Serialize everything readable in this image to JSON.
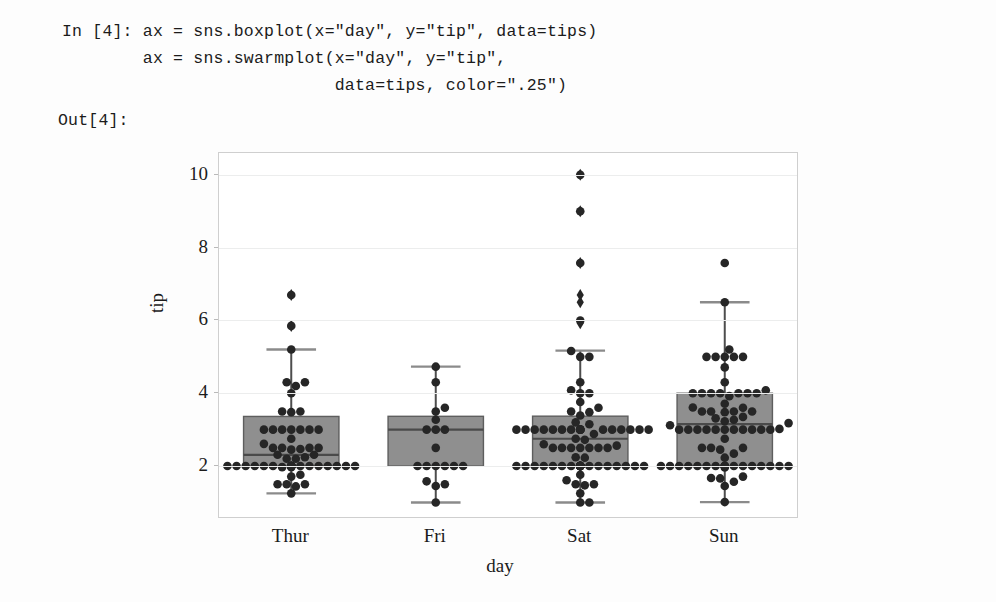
{
  "notebook": {
    "in_prompt": "In [4]:",
    "out_prompt": "Out[4]:",
    "code_line_1": "In [4]: ax = sns.boxplot(x=\"day\", y=\"tip\", data=tips)",
    "code_line_2": "        ax = sns.swarmplot(x=\"day\", y=\"tip\",",
    "code_line_3": "                           data=tips, color=\".25\")",
    "out_line": "Out[4]:"
  },
  "chart_data": {
    "type": "box",
    "title": "",
    "xlabel": "day",
    "ylabel": "tip",
    "categories": [
      "Thur",
      "Fri",
      "Sat",
      "Sun"
    ],
    "yticks": [
      2,
      4,
      6,
      8,
      10
    ],
    "ylim": [
      0.6,
      10.6
    ],
    "grid": true,
    "legend": "none",
    "box_color": "#8f8f8f",
    "line_color": "#4d4d4d",
    "point_color": "#262626",
    "series": [
      {
        "name": "Thur",
        "q1": 2.0,
        "median": 2.305,
        "q3": 3.3625,
        "whisker_low": 1.25,
        "whisker_high": 5.2,
        "outliers": [
          5.85,
          6.7
        ],
        "points": [
          3.0,
          1.5,
          2.2,
          3.48,
          1.71,
          2.31,
          4.3,
          2.0,
          2.0,
          2.0,
          2.0,
          2.0,
          1.5,
          1.76,
          1.97,
          2.31,
          1.44,
          2.5,
          3.0,
          5.85,
          2.0,
          2.0,
          2.0,
          3.0,
          2.5,
          2.0,
          2.61,
          2.0,
          2.24,
          4.2,
          3.5,
          2.0,
          2.0,
          4.0,
          2.0,
          3.0,
          2.5,
          2.5,
          2.0,
          2.0,
          2.2,
          2.0,
          6.7,
          3.0,
          2.0,
          3.5,
          2.75,
          2.0,
          2.45,
          1.25,
          2.0,
          2.0,
          1.5,
          2.0,
          2.0,
          2.47,
          3.0,
          4.3,
          5.2,
          1.97,
          3.0,
          2.0
        ]
      },
      {
        "name": "Fri",
        "q1": 2.0,
        "median": 3.0,
        "q3": 3.3662,
        "whisker_low": 1.0,
        "whisker_high": 4.73,
        "outliers": [],
        "points": [
          4.3,
          3.0,
          1.45,
          2.5,
          3.5,
          2.0,
          3.27,
          3.6,
          1.0,
          2.0,
          1.5,
          4.73,
          2.0,
          2.0,
          1.58,
          2.0,
          3.0,
          2.0,
          3.0
        ]
      },
      {
        "name": "Sat",
        "q1": 2.0,
        "median": 2.75,
        "q3": 3.37,
        "whisker_low": 1.0,
        "whisker_high": 5.17,
        "outliers": [
          5.92,
          6.5,
          6.7,
          7.58,
          9.0,
          10.0
        ],
        "points": [
          2.0,
          3.0,
          2.5,
          3.0,
          3.0,
          1.5,
          2.0,
          3.2,
          3.15,
          2.0,
          3.0,
          1.0,
          2.0,
          5.0,
          2.0,
          2.5,
          3.0,
          3.48,
          2.24,
          4.0,
          2.5,
          2.6,
          1.5,
          2.0,
          3.0,
          2.0,
          2.0,
          2.0,
          4.3,
          1.76,
          2.5,
          2.0,
          2.56,
          3.0,
          2.72,
          2.88,
          3.39,
          1.47,
          3.0,
          1.25,
          1.0,
          3.0,
          5.0,
          2.0,
          2.0,
          3.0,
          2.5,
          2.0,
          3.0,
          2.01,
          2.0,
          2.5,
          4.0,
          3.0,
          3.0,
          2.0,
          3.0,
          2.0,
          4.08,
          2.75,
          2.23,
          7.58,
          3.5,
          2.0,
          2.0,
          9.0,
          10.0,
          3.0,
          2.0,
          2.0,
          2.0,
          5.16,
          6.0,
          2.0,
          3.6,
          3.0,
          2.0,
          2.0,
          3.0,
          2.5,
          3.0,
          2.0,
          1.61,
          2.0,
          3.76,
          2.0,
          2.0
        ]
      },
      {
        "name": "Sun",
        "q1": 2.0,
        "median": 3.15,
        "q3": 4.0,
        "whisker_low": 1.01,
        "whisker_high": 6.5,
        "outliers": [],
        "points": [
          1.01,
          1.66,
          3.5,
          3.31,
          3.61,
          4.71,
          2.0,
          3.12,
          1.96,
          3.23,
          1.71,
          5.0,
          1.57,
          3.0,
          3.02,
          3.92,
          1.67,
          3.71,
          3.5,
          3.35,
          4.08,
          2.75,
          2.23,
          7.58,
          3.18,
          2.34,
          2.0,
          2.0,
          4.3,
          3.0,
          1.45,
          2.5,
          3.0,
          2.45,
          3.27,
          3.6,
          2.0,
          2.0,
          2.5,
          2.0,
          3.48,
          5.0,
          2.0,
          2.0,
          2.5,
          3.0,
          4.0,
          3.5,
          2.0,
          5.0,
          3.0,
          2.0,
          3.0,
          4.0,
          6.5,
          2.0,
          2.0,
          2.0,
          3.0,
          4.0,
          3.5,
          2.0,
          2.0,
          5.2,
          3.0,
          2.0,
          4.0,
          5.0,
          2.0,
          4.0,
          3.0,
          2.0,
          3.0,
          4.0,
          5.0,
          2.0,
          3.0,
          4.0
        ]
      }
    ]
  }
}
